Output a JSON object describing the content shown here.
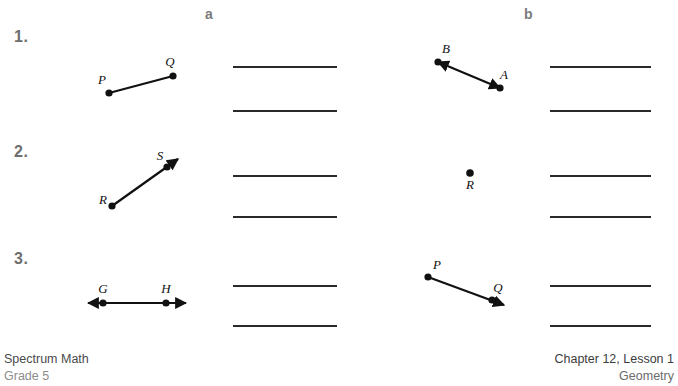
{
  "headers": {
    "col_a": "a",
    "col_b": "b"
  },
  "problems": [
    {
      "number": "1.",
      "a": {
        "figure_type": "segment",
        "labels": [
          "P",
          "Q"
        ],
        "description": "line segment PQ with endpoints marked"
      },
      "b": {
        "figure_type": "line",
        "labels": [
          "B",
          "A"
        ],
        "description": "line AB with arrowheads on both ends"
      }
    },
    {
      "number": "2.",
      "a": {
        "figure_type": "ray",
        "labels": [
          "R",
          "S"
        ],
        "description": "ray RS with arrowhead past S"
      },
      "b": {
        "figure_type": "point",
        "labels": [
          "R"
        ],
        "description": "single point R"
      }
    },
    {
      "number": "3.",
      "a": {
        "figure_type": "line",
        "labels": [
          "G",
          "H"
        ],
        "description": "horizontal line GH with arrowheads on both ends"
      },
      "b": {
        "figure_type": "ray",
        "labels": [
          "P",
          "Q"
        ],
        "description": "ray PQ with arrowhead past Q"
      }
    }
  ],
  "footer": {
    "left_line1": "Spectrum Math",
    "left_line2": "Grade 5",
    "right_line1": "Chapter 12, Lesson 1",
    "right_line2": "Geometry"
  },
  "colors": {
    "ink": "#111111",
    "rule": "#2a2a2a",
    "number_gray": "#6e6e6e",
    "header_gray": "#7b7b7b"
  }
}
